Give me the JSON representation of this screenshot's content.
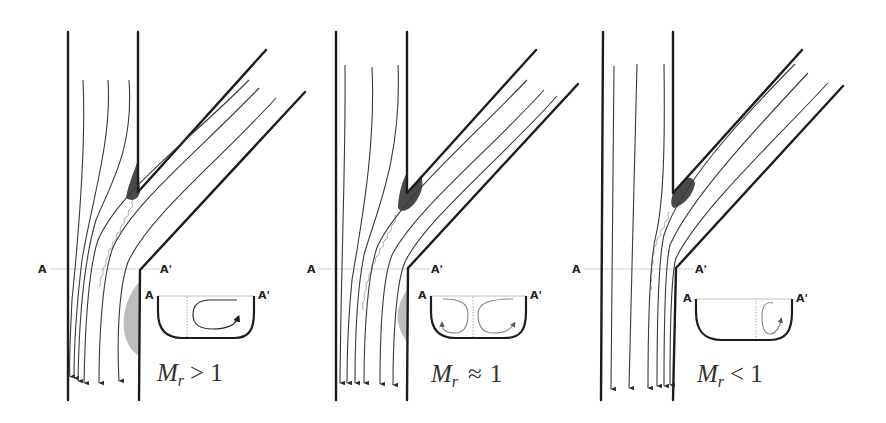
{
  "figure": {
    "section_label_left": "A",
    "section_label_right": "A'",
    "panels": [
      {
        "id": "panel-1",
        "condition": {
          "symbol": "M",
          "subscript": "r",
          "relation": ">",
          "value": "1"
        },
        "inset_vortices": "single clockwise vortex in right half",
        "colors": {
          "separation_upper": "#4a4a4a",
          "separation_lower": "#bdbdbd"
        }
      },
      {
        "id": "panel-2",
        "condition": {
          "symbol": "M",
          "subscript": "r",
          "relation": "≈",
          "value": "1"
        },
        "inset_vortices": "two counter-rotating vortices",
        "colors": {
          "separation_upper": "#4a4a4a",
          "separation_lower": "#bdbdbd"
        }
      },
      {
        "id": "panel-3",
        "condition": {
          "symbol": "M",
          "subscript": "r",
          "relation": "<",
          "value": "1"
        },
        "inset_vortices": "small vortex in right half",
        "colors": {
          "separation_upper": "#4a4a4a"
        }
      }
    ]
  }
}
